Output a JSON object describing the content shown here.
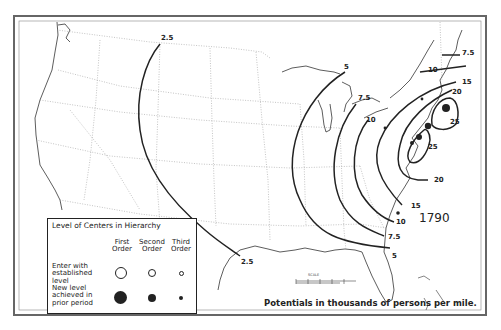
{
  "map": {
    "year": "1790",
    "caption": "Potentials in thousands of persons per mile.",
    "scale_label": "SCALE",
    "frame_color": "#555555",
    "line_color": "#222222"
  },
  "legend": {
    "title": "Level of Centers in Hierarchy",
    "columns": [
      {
        "line1": "First",
        "line2": "Order"
      },
      {
        "line1": "Second",
        "line2": "Order"
      },
      {
        "line1": "Third",
        "line2": "Order"
      }
    ],
    "rows": [
      {
        "label_lines": [
          "Enter with",
          "established level"
        ],
        "symbol": "hollow-circle"
      },
      {
        "label_lines": [
          "New level",
          "achieved in",
          "prior period"
        ],
        "symbol": "filled-circle"
      }
    ]
  },
  "isolines": [
    {
      "value": "2.5",
      "label_positions": [
        "north",
        "south"
      ]
    },
    {
      "value": "5"
    },
    {
      "value": "7.5"
    },
    {
      "value": "10"
    },
    {
      "value": "15"
    },
    {
      "value": "20"
    },
    {
      "value": "25"
    }
  ],
  "labels": {
    "l_25_n": "2.5",
    "l_25_s": "2.5",
    "l_5_n": "5",
    "l_5_s": "5",
    "l_75_n": "7.5",
    "l_75_ne": "7.5",
    "l_75_s": "7.5",
    "l_10_n": "10",
    "l_10_ne": "10",
    "l_10_s": "10",
    "l_15_ne": "15",
    "l_15_s": "15",
    "l_20_ne": "20",
    "l_20_s": "20",
    "l_25a": "25",
    "l_25b": "25"
  }
}
